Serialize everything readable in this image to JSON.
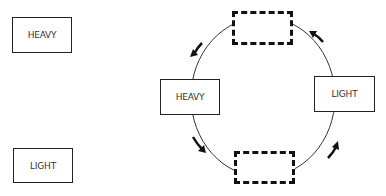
{
  "diagram": {
    "legend_boxes": [
      {
        "label": "HEAVY"
      },
      {
        "label": "LIGHT"
      }
    ],
    "cycle": {
      "left_box": {
        "label": "HEAVY"
      },
      "right_box": {
        "label": "LIGHT"
      },
      "top_slot": {
        "label": ""
      },
      "bottom_slot": {
        "label": ""
      },
      "direction": "counterclockwise"
    },
    "colors": {
      "stroke": "#222222",
      "background": "#ffffff"
    }
  }
}
